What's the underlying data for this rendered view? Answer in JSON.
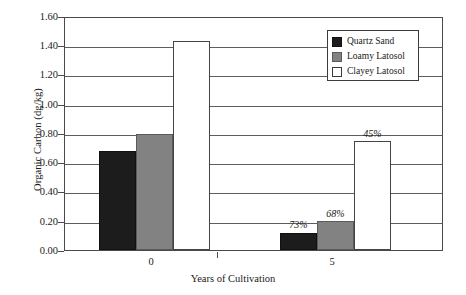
{
  "chart_data": {
    "type": "bar",
    "title": "",
    "xlabel": "Years of Cultivation",
    "ylabel": "Organic Carbon (dg/kg)",
    "categories": [
      "0",
      "5"
    ],
    "ylim": [
      0.0,
      1.6
    ],
    "ytick_labels": [
      "1.60",
      "1.40",
      "1.20",
      "1.00",
      "0.80",
      "0.60",
      "0.40",
      "0.20",
      "0.00"
    ],
    "ytick_values": [
      1.6,
      1.4,
      1.2,
      1.0,
      0.8,
      0.6,
      0.4,
      0.2,
      0.0
    ],
    "grid": "horizontal",
    "legend_position": "top-right",
    "series": [
      {
        "name": "Quartz Sand",
        "color": "#1c1c1c",
        "values": [
          0.68,
          0.12
        ],
        "annotations": [
          "",
          "73%"
        ]
      },
      {
        "name": "Loamy Latosol",
        "color": "#828282",
        "values": [
          0.8,
          0.2
        ],
        "annotations": [
          "",
          "68%"
        ]
      },
      {
        "name": "Clayey Latosol",
        "color": "#ffffff",
        "values": [
          1.44,
          0.75
        ],
        "annotations": [
          "",
          "45%"
        ]
      }
    ]
  },
  "axes": {
    "y_title": "Organic Carbon (dg/kg)",
    "x_title": "Years of Cultivation",
    "y_ticks": [
      {
        "label": "1.60"
      },
      {
        "label": "1.40"
      },
      {
        "label": "1.20"
      },
      {
        "label": "1.00"
      },
      {
        "label": "0.80"
      },
      {
        "label": "0.60"
      },
      {
        "label": "0.40"
      },
      {
        "label": "0.20"
      },
      {
        "label": "0.00"
      }
    ],
    "x_ticks": [
      {
        "label": "0"
      },
      {
        "label": "5"
      }
    ]
  },
  "legend": {
    "items": [
      {
        "label": "Quartz Sand"
      },
      {
        "label": "Loamy Latosol"
      },
      {
        "label": "Clayey Latosol"
      }
    ]
  },
  "annotations": {
    "quartz_year5": "73%",
    "loamy_year5": "68%",
    "clayey_year5": "45%"
  }
}
